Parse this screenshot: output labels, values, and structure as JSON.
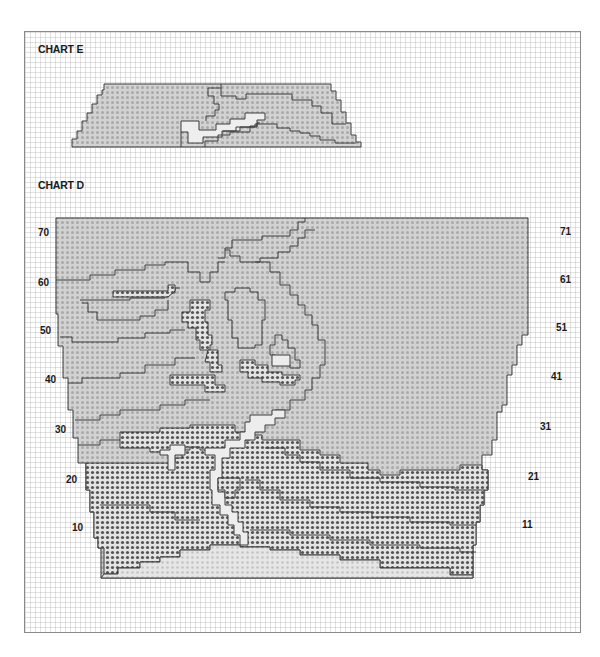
{
  "charts": [
    {
      "id": "E",
      "title": "CHART E"
    },
    {
      "id": "D",
      "title": "CHART D",
      "row_labels_left": [
        "70",
        "60",
        "50",
        "40",
        "30",
        "20",
        "10"
      ],
      "row_labels_right": [
        "71",
        "61",
        "51",
        "41",
        "31",
        "21",
        "11"
      ]
    }
  ],
  "legend_colors": {
    "light_dot_fill": "#c8c8c8",
    "dark_dot_fill": "#8c8c8c",
    "white_fill": "#ececec",
    "outline": "#3c3c3c",
    "grid": "#d6d6d6"
  }
}
